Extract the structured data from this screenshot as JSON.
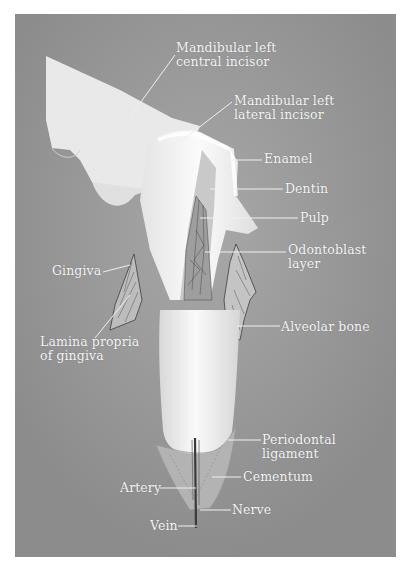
{
  "figure": {
    "labels": {
      "central_incisor": [
        "Mandibular left",
        "central incisor"
      ],
      "lateral_incisor": [
        "Mandibular left",
        "lateral incisor"
      ],
      "enamel": "Enamel",
      "dentin": "Dentin",
      "pulp": "Pulp",
      "odontoblast": [
        "Odontoblast",
        "layer"
      ],
      "gingiva": "Gingiva",
      "lamina_propria": [
        "Lamina propria",
        "of gingiva"
      ],
      "alveolar_bone": "Alveolar bone",
      "periodontal": [
        "Periodontal",
        "ligament"
      ],
      "cementum": "Cementum",
      "artery": "Artery",
      "nerve": "Nerve",
      "vein": "Vein"
    },
    "colors": {
      "background": "#8f8f8f",
      "tooth": "#f2f2f2",
      "label_text": "#f4f4f4"
    }
  }
}
